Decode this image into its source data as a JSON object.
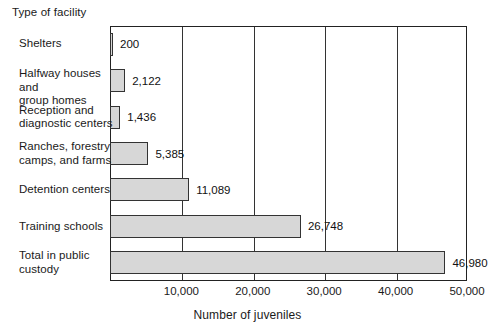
{
  "chart_data": {
    "type": "bar",
    "orientation": "horizontal",
    "title": "",
    "ylabel": "Type of facility",
    "xlabel": "Number of juveniles",
    "categories": [
      "Shelters",
      "Halfway houses and group homes",
      "Reception and diagnostic centers",
      "Ranches, forestry camps, and farms",
      "Detention centers",
      "Training schools",
      "Total in public custody"
    ],
    "values": [
      200,
      2122,
      1436,
      5385,
      11089,
      26748,
      46980
    ],
    "value_labels": [
      "200",
      "2,122",
      "1,436",
      "5,385",
      "11,089",
      "26,748",
      "46,980"
    ],
    "xlim": [
      0,
      50000
    ],
    "xticks": [
      10000,
      20000,
      30000,
      40000,
      50000
    ],
    "xtick_labels": [
      "10,000",
      "20,000",
      "30,000",
      "40,000",
      "50,000"
    ],
    "grid": true,
    "legend": "none",
    "bar_fill_color": "#d7d7d7",
    "bar_edge_color": "#333333",
    "frame_color": "#222222"
  },
  "labels": {
    "category_lines": [
      [
        "Shelters"
      ],
      [
        "Halfway houses and",
        "group homes"
      ],
      [
        "Reception and",
        "diagnostic centers"
      ],
      [
        "Ranches, forestry",
        "camps, and farms"
      ],
      [
        "Detention centers"
      ],
      [
        "Training schools"
      ],
      [
        "Total in public",
        "custody"
      ]
    ]
  }
}
